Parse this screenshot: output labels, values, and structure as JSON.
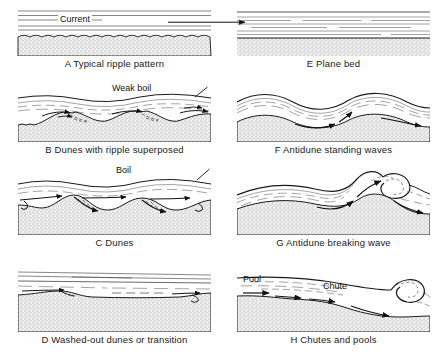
{
  "figure": {
    "bed_fill": "#e8e8e8",
    "line_color": "#1a1a1a",
    "background": "#ffffff"
  },
  "panels": [
    {
      "id": "A",
      "letter": "A",
      "caption": "A Typical ripple pattern",
      "title": "Typical ripple pattern",
      "annotations": [
        {
          "label": "Current",
          "kind": "flow-arrow"
        }
      ],
      "regime": "lower",
      "surface": "flat",
      "bedform": "ripples"
    },
    {
      "id": "B",
      "letter": "B",
      "caption": "B Dunes with ripple superposed",
      "title": "Dunes with ripple superposed",
      "annotations": [
        {
          "label": "Weak boil",
          "kind": "leader-label"
        }
      ],
      "regime": "lower",
      "surface": "out-of-phase",
      "bedform": "dunes-with-ripples"
    },
    {
      "id": "C",
      "letter": "C",
      "caption": "C Dunes",
      "title": "Dunes",
      "annotations": [
        {
          "label": "Boil",
          "kind": "leader-label"
        }
      ],
      "regime": "lower",
      "surface": "out-of-phase",
      "bedform": "dunes"
    },
    {
      "id": "D",
      "letter": "D",
      "caption": "D Washed-out dunes or transition",
      "title": "Washed-out dunes or transition",
      "annotations": [],
      "regime": "transition",
      "surface": "nearly-flat",
      "bedform": "washed-out-dunes"
    },
    {
      "id": "E",
      "letter": "E",
      "caption": "E Plane bed",
      "title": "Plane bed",
      "annotations": [],
      "regime": "upper",
      "surface": "flat",
      "bedform": "plane-bed"
    },
    {
      "id": "F",
      "letter": "F",
      "caption": "F Antidune standing waves",
      "title": "Antidune standing waves",
      "annotations": [],
      "regime": "upper",
      "surface": "in-phase",
      "bedform": "antidunes"
    },
    {
      "id": "G",
      "letter": "G",
      "caption": "G Antidune breaking wave",
      "title": "Antidune breaking wave",
      "annotations": [],
      "regime": "upper",
      "surface": "breaking",
      "bedform": "antidunes"
    },
    {
      "id": "H",
      "letter": "H",
      "caption": "H Chutes and pools",
      "title": "Chutes and pools",
      "annotations": [
        {
          "label": "Pool",
          "kind": "plain-label"
        },
        {
          "label": "Chute",
          "kind": "plain-label"
        }
      ],
      "regime": "upper",
      "surface": "hydraulic-jump",
      "bedform": "chutes-and-pools"
    }
  ]
}
